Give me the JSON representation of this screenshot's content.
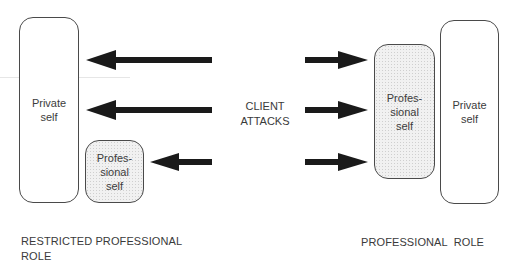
{
  "diagram": {
    "left_group": {
      "caption": "RESTRICTED PROFESSIONAL\nROLE",
      "private_self": {
        "label": "Private\nself"
      },
      "professional_self": {
        "label": "Profes-\nsional\nself"
      }
    },
    "center": {
      "label": "CLIENT\nATTACKS",
      "arrows_left": [
        {
          "direction": "left",
          "y": 60,
          "x_from": 212,
          "x_to": 86
        },
        {
          "direction": "left",
          "y": 110,
          "x_from": 212,
          "x_to": 86
        },
        {
          "direction": "left",
          "y": 162,
          "x_from": 212,
          "x_to": 150
        }
      ],
      "arrows_right": [
        {
          "direction": "right",
          "y": 60,
          "x_from": 305,
          "x_to": 368
        },
        {
          "direction": "right",
          "y": 110,
          "x_from": 305,
          "x_to": 368
        },
        {
          "direction": "right",
          "y": 162,
          "x_from": 305,
          "x_to": 368
        }
      ]
    },
    "right_group": {
      "caption": "PROFESSIONAL  ROLE",
      "professional_self": {
        "label": "Profes-\nsional\nself"
      },
      "private_self": {
        "label": "Private\nself"
      }
    },
    "colors": {
      "arrow": "#1a1a1a",
      "outline": "#4a4a4a",
      "text": "#3a3a3a",
      "professional_fill": "#efefef"
    }
  }
}
